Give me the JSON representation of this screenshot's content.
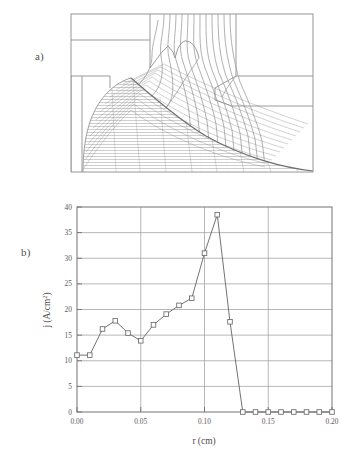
{
  "figure": {
    "panel_a": {
      "label": "a)",
      "caption_kind": "electrode-geometry-and-beam-trajectories"
    },
    "panel_b": {
      "label": "b)"
    }
  },
  "chart_data": {
    "type": "line",
    "title": "",
    "xlabel": "r (cm)",
    "ylabel_main": "j (A/cm",
    "ylabel_sup": "2",
    "ylabel_tail": ")",
    "ylabel_full": "j (A/cm2)",
    "xlim": [
      0.0,
      0.2
    ],
    "ylim": [
      0,
      40
    ],
    "xticks": [
      0.0,
      0.05,
      0.1,
      0.15,
      0.2
    ],
    "xticklabels": [
      "0.00",
      "0.05",
      "0.10",
      "0.15",
      "0.20"
    ],
    "yticks": [
      0,
      5,
      10,
      15,
      20,
      25,
      30,
      35,
      40
    ],
    "yticklabels": [
      "0",
      "5",
      "10",
      "15",
      "20",
      "25",
      "30",
      "35",
      "40"
    ],
    "grid": true,
    "grid_axis": "y-and-x-major",
    "legend": false,
    "marker": "open-square",
    "series": [
      {
        "name": "current density",
        "x": [
          0.0,
          0.01,
          0.02,
          0.03,
          0.04,
          0.05,
          0.06,
          0.07,
          0.08,
          0.09,
          0.1,
          0.11,
          0.12,
          0.13,
          0.14,
          0.15,
          0.16,
          0.17,
          0.18,
          0.19,
          0.2
        ],
        "values": [
          11.1,
          11.1,
          16.2,
          17.8,
          15.4,
          13.9,
          17.0,
          19.1,
          20.8,
          22.2,
          31.0,
          38.5,
          17.6,
          0.0,
          0.0,
          0.0,
          0.0,
          0.0,
          0.0,
          0.0,
          0.0
        ]
      }
    ]
  },
  "colors": {
    "line": "#6e696c",
    "marker_stroke": "#6e696c",
    "marker_fill": "#ffffff",
    "axis": "#757073",
    "grid": "#9c989a",
    "text": "#55504f",
    "panel_a_outline": "#8d8a8c",
    "panel_a_contour": "#a09da0",
    "panel_a_beam": "#6f6c6e",
    "background": "#ffffff"
  }
}
